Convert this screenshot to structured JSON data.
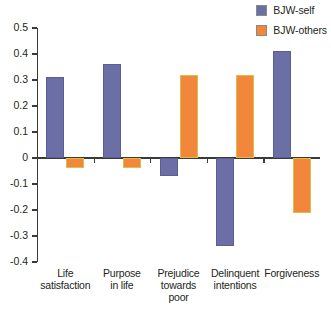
{
  "chart_data": {
    "type": "bar",
    "title": "",
    "xlabel": "",
    "ylabel": "",
    "ylim": [
      -0.4,
      0.5
    ],
    "grid": false,
    "legend_position": "top-right",
    "categories": [
      "Life satisfaction",
      "Purpose in life",
      "Prejudice towards poor",
      "Delinquent intentions",
      "Forgiveness"
    ],
    "category_lines": [
      [
        "Life",
        "satisfaction"
      ],
      [
        "Purpose",
        "in life"
      ],
      [
        "Prejudice",
        "towards",
        "poor"
      ],
      [
        "Delinquent",
        "intentions"
      ],
      [
        "Forgiveness"
      ]
    ],
    "ytick_labels": [
      "0.5",
      "0.4",
      "0.3",
      "0.2",
      "0.1",
      "0",
      "-0.1",
      "-0.2",
      "-0.3",
      "-0.4"
    ],
    "ytick_values": [
      0.5,
      0.4,
      0.3,
      0.2,
      0.1,
      0,
      -0.1,
      -0.2,
      -0.3,
      -0.4
    ],
    "series": [
      {
        "name": "BJW-self",
        "color": "#6c6fa6",
        "values": [
          0.31,
          0.36,
          -0.07,
          -0.34,
          0.41
        ]
      },
      {
        "name": "BJW-others",
        "color": "#f2873c",
        "values": [
          -0.04,
          -0.04,
          0.32,
          0.32,
          -0.21
        ]
      }
    ]
  },
  "legend": {
    "items": [
      {
        "label": "BJW-self",
        "color": "#6c6fa6"
      },
      {
        "label": "BJW-others",
        "color": "#f2873c"
      }
    ]
  }
}
